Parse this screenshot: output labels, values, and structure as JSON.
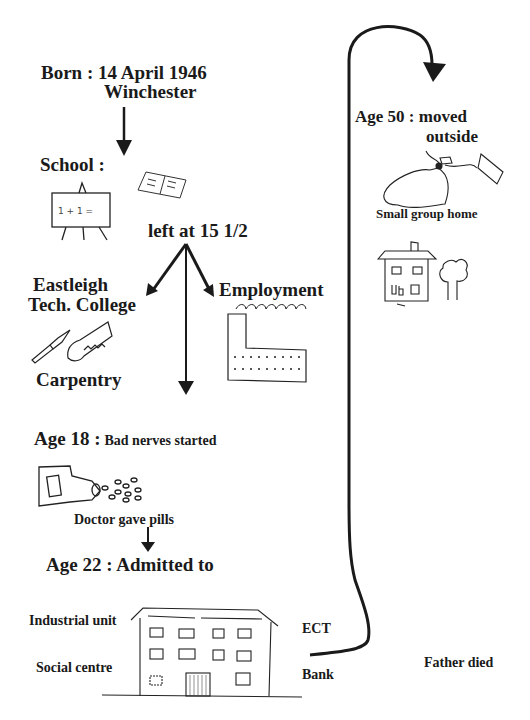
{
  "diagram": {
    "type": "life-history-timeline",
    "nodes": {
      "born": {
        "title": "Born : 14 April 1946",
        "place": "Winchester"
      },
      "school": {
        "label": "School :",
        "board_text": "1+1="
      },
      "left": {
        "label": "left at 15 1/2"
      },
      "college": {
        "line1": "Eastleigh",
        "line2": "Tech. College",
        "skill": "Carpentry"
      },
      "employment": {
        "label": "Employment"
      },
      "age18": {
        "prefix": "Age 18 :",
        "text": "Bad nerves started"
      },
      "pills": {
        "label": "Doctor gave pills"
      },
      "age22": {
        "label": "Age 22 : Admitted to"
      },
      "hospital": {
        "left_labels": [
          "Industrial unit",
          "Social centre"
        ],
        "right_labels": [
          "ECT",
          "Bank"
        ]
      },
      "father": {
        "label": "Father died"
      },
      "age50": {
        "line1": "Age 50 : moved",
        "line2": "outside"
      },
      "group_home": {
        "label": "Small group home"
      }
    },
    "edges": [
      {
        "from": "born",
        "to": "school"
      },
      {
        "from": "left",
        "to": "college"
      },
      {
        "from": "left",
        "to": "employment"
      },
      {
        "from": "left",
        "to": "age18"
      },
      {
        "from": "pills",
        "to": "age22"
      },
      {
        "from": "hospital",
        "to": "age50"
      }
    ]
  }
}
